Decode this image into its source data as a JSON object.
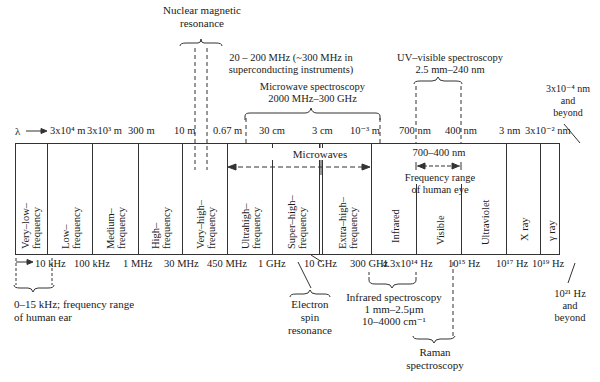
{
  "annotations_top": {
    "nmr": {
      "line1": "Nuclear magnetic",
      "line2": "resonance"
    },
    "nmr_range": {
      "line1": "20 – 200 MHz (~300 MHz in",
      "line2": "superconducting instruments)"
    },
    "microwave_spec": {
      "line1": "Microwave spectroscopy",
      "line2": "2000 MHz–300 GHz"
    },
    "uv_vis": {
      "line1": "UV–visible spectroscopy",
      "line2": "2.5 mm–240 nm"
    },
    "gamma_wavelength": {
      "line1": "3x10⁻⁴ nm",
      "line2": "and",
      "line3": "beyond"
    }
  },
  "wavelength_axis": {
    "symbol": "λ",
    "ticks": [
      "3x10⁴ m",
      "3x10³ m",
      "300 m",
      "10 m",
      "0.67 m",
      "30 cm",
      "3 cm",
      "10⁻³ m",
      "700 nm",
      "400 nm",
      "3 nm",
      "3x10⁻² nm"
    ]
  },
  "inner_labels": {
    "microwaves": "Microwaves",
    "visible_range": "700–400 nm",
    "eye_line1": "Frequency range",
    "eye_line2": "of human eye"
  },
  "bands": [
    {
      "line1": "Very–low–",
      "line2": "frequency"
    },
    {
      "line1": "Low–",
      "line2": "frequency"
    },
    {
      "line1": "Medium–",
      "line2": "frequency"
    },
    {
      "line1": "High–",
      "line2": "frequency"
    },
    {
      "line1": "Very–high–",
      "line2": "frequency"
    },
    {
      "line1": "Ultrahigh–",
      "line2": "frequency"
    },
    {
      "line1": "Super–high–",
      "line2": "frequency"
    },
    {
      "line1": "Extra–high–",
      "line2": "frequency"
    },
    {
      "line1": "Infrared",
      "line2": ""
    },
    {
      "line1": "Visible",
      "line2": ""
    },
    {
      "line1": "Ultraviolet",
      "line2": ""
    },
    {
      "line1": "X ray",
      "line2": ""
    },
    {
      "line1": "γ ray",
      "line2": ""
    }
  ],
  "frequency_axis": {
    "ticks": [
      "10 kHz",
      "100 kHz",
      "1 MHz",
      "30 MHz",
      "450 MHz",
      "1 GHz",
      "10 GHz",
      "300 GHz",
      "4.3x10¹⁴ Hz",
      "10¹⁵ Hz",
      "10¹⁷ Hz",
      "10¹⁹ Hz"
    ]
  },
  "annotations_bottom": {
    "ear": {
      "line1": "0–15 kHz; frequency range",
      "line2": "of human ear"
    },
    "esr": {
      "line1": "Electron",
      "line2": "spin",
      "line3": "resonance"
    },
    "ir_spec": {
      "line1": "Infrared spectroscopy",
      "line2": "1 mm–2.5μm",
      "line3": "10–4000 cm⁻¹"
    },
    "raman": {
      "line1": "Raman",
      "line2": "spectroscopy"
    },
    "gamma_freq": {
      "line1": "10²¹ Hz",
      "line2": "and",
      "line3": "beyond"
    }
  }
}
